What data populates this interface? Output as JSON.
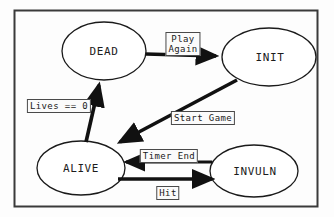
{
  "diagram": {
    "border_color": "#3a3a3a",
    "background_color": "#fdfdfd",
    "stroke_color": "#1a1a1a",
    "frame": {
      "x": 14,
      "y": 10,
      "width": 304,
      "height": 197
    },
    "nodes": [
      {
        "id": "dead",
        "label": "DEAD",
        "cx": 104,
        "cy": 51,
        "rx": 42,
        "ry": 29
      },
      {
        "id": "init",
        "label": "INIT",
        "cx": 269,
        "cy": 57,
        "rx": 47,
        "ry": 29
      },
      {
        "id": "alive",
        "label": "ALIVE",
        "cx": 81,
        "cy": 168,
        "rx": 44,
        "ry": 27
      },
      {
        "id": "invuln",
        "label": "INVULN",
        "cx": 254,
        "cy": 171,
        "rx": 44,
        "ry": 26
      }
    ],
    "edges": [
      {
        "id": "dead-to-init",
        "from": "DEAD",
        "to": "INIT",
        "label": "Play\nAgain",
        "label_x": 183,
        "label_y": 44,
        "label_width": 32
      },
      {
        "id": "init-to-alive",
        "from": "INIT",
        "to": "ALIVE",
        "label": "Start Game",
        "label_x": 203,
        "label_y": 118,
        "label_width": 65
      },
      {
        "id": "alive-to-dead",
        "from": "ALIVE",
        "to": "DEAD",
        "label": "Lives == 0",
        "label_x": 59,
        "label_y": 106,
        "label_width": 68
      },
      {
        "id": "invuln-to-alive",
        "from": "INVULN",
        "to": "ALIVE",
        "label": "Timer End",
        "label_x": 169,
        "label_y": 156,
        "label_width": 58
      },
      {
        "id": "alive-to-invuln",
        "from": "ALIVE",
        "to": "INVULN",
        "label": "Hit",
        "label_x": 168,
        "label_y": 193,
        "label_width": 20
      }
    ]
  }
}
